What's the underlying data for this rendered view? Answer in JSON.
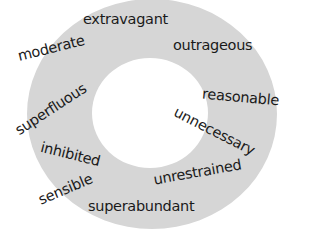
{
  "diagram": {
    "type": "word-ring",
    "ring_color": "#d6d6d6",
    "background_color": "#ffffff",
    "text_color": "#1a1a1a",
    "words": [
      {
        "id": "extravagant",
        "text": "extravagant",
        "x": 83,
        "y": 12,
        "rotate": 0
      },
      {
        "id": "outrageous",
        "text": "outrageous",
        "x": 173,
        "y": 38,
        "rotate": 0
      },
      {
        "id": "moderate",
        "text": "moderate",
        "x": 17,
        "y": 41,
        "rotate": -14
      },
      {
        "id": "reasonable",
        "text": "reasonable",
        "x": 202,
        "y": 90,
        "rotate": 5
      },
      {
        "id": "superfluous",
        "text": "superfluous",
        "x": 10,
        "y": 102,
        "rotate": -33
      },
      {
        "id": "unnecessary",
        "text": "unnecessary",
        "x": 170,
        "y": 124,
        "rotate": 27
      },
      {
        "id": "inhibited",
        "text": "inhibited",
        "x": 40,
        "y": 147,
        "rotate": 14
      },
      {
        "id": "unrestrained",
        "text": "unrestrained",
        "x": 153,
        "y": 165,
        "rotate": -10
      },
      {
        "id": "sensible",
        "text": "sensible",
        "x": 37,
        "y": 182,
        "rotate": -23
      },
      {
        "id": "superabundant",
        "text": "superabundant",
        "x": 88,
        "y": 199,
        "rotate": 0
      }
    ]
  }
}
